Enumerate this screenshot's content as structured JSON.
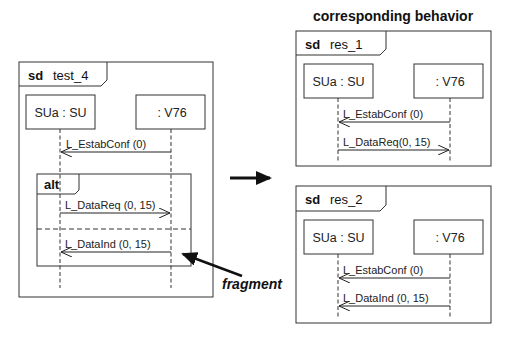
{
  "title": "corresponding behavior",
  "annotation": "fragment",
  "test_diagram": {
    "keyword": "sd",
    "name": "test_4",
    "lifelines": [
      "SUa : SU",
      ": V76"
    ],
    "messages": [
      {
        "label": "L_EstabConf (0)",
        "from": ": V76",
        "to": "SUa : SU"
      }
    ],
    "fragment": {
      "operator": "alt",
      "operands": [
        {
          "message": {
            "label": "L_DataReq (0, 15)",
            "from": "SUa : SU",
            "to": ": V76"
          }
        },
        {
          "message": {
            "label": "L_DataInd (0, 15)",
            "from": ": V76",
            "to": "SUa : SU"
          }
        }
      ]
    }
  },
  "results": [
    {
      "keyword": "sd",
      "name": "res_1",
      "lifelines": [
        "SUa : SU",
        ": V76"
      ],
      "messages": [
        {
          "label": "L_EstabConf (0)",
          "from": ": V76",
          "to": "SUa : SU"
        },
        {
          "label": "L_DataReq(0, 15)",
          "from": "SUa : SU",
          "to": ": V76"
        }
      ]
    },
    {
      "keyword": "sd",
      "name": "res_2",
      "lifelines": [
        "SUa : SU",
        ": V76"
      ],
      "messages": [
        {
          "label": "L_EstabConf (0)",
          "from": ": V76",
          "to": "SUa : SU"
        },
        {
          "label": "L_DataInd (0, 15)",
          "from": ": V76",
          "to": "SUa : SU"
        }
      ]
    }
  ]
}
